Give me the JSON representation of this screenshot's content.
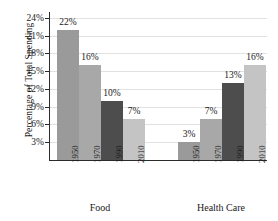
{
  "chart_data": {
    "type": "bar",
    "title": "",
    "xlabel": "",
    "ylabel": "Percentage of Total Spending",
    "ylim": [
      0,
      25
    ],
    "grid": true,
    "legend": "none",
    "categories": [
      "1950",
      "1970",
      "1990",
      "2010"
    ],
    "groups": [
      {
        "name": "Food",
        "values": [
          22,
          16,
          10,
          7
        ],
        "value_labels": [
          "22%",
          "16%",
          "10%",
          "7%"
        ]
      },
      {
        "name": "Health Care",
        "values": [
          3,
          7,
          13,
          16
        ],
        "value_labels": [
          "3%",
          "7%",
          "13%",
          "16%"
        ]
      }
    ],
    "yticks": [
      3,
      6,
      9,
      12,
      15,
      18,
      21,
      24
    ],
    "ytick_labels": [
      "3%",
      "6%",
      "9%",
      "12%",
      "15%",
      "18%",
      "21%",
      "24%"
    ],
    "bar_colors": [
      "#9a9a9a",
      "#a8a8a8",
      "#4d4d4d",
      "#c4c4c4"
    ]
  },
  "axis": {
    "y_title": "Percentage of Total Spending"
  },
  "colors": {
    "background": "#ffffff",
    "axis": "#2b2b2b",
    "gridline": "#e2e2e2",
    "text": "#1a1a1a"
  }
}
